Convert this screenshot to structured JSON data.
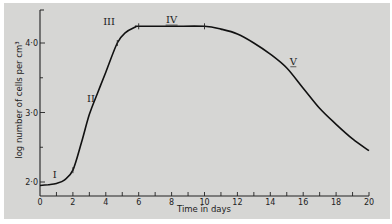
{
  "chart_data": {
    "type": "line",
    "title": "",
    "xlabel": "Time in days",
    "ylabel": "log number of cells per cm³",
    "xlim": [
      0,
      20
    ],
    "ylim": [
      1.8,
      4.5
    ],
    "x_ticks": [
      0,
      2,
      4,
      6,
      8,
      10,
      12,
      14,
      16,
      18,
      20
    ],
    "x_tick_labels": [
      "0",
      "2",
      "4",
      "6",
      "8",
      "10",
      "12",
      "14",
      "16",
      "18",
      "20"
    ],
    "y_ticks": [
      2.0,
      3.0,
      4.0
    ],
    "y_tick_labels": [
      "2·0",
      "3·0",
      "4·0"
    ],
    "grid": false,
    "legend": null,
    "series": [
      {
        "name": "cell growth curve",
        "x": [
          0,
          0.5,
          1,
          1.5,
          2,
          2.5,
          3,
          3.5,
          4,
          4.7,
          5.2,
          5.8,
          6,
          8,
          10,
          11,
          12,
          13,
          14,
          15,
          16,
          17,
          18,
          19,
          20
        ],
        "y": [
          1.95,
          1.96,
          1.98,
          2.03,
          2.17,
          2.55,
          2.97,
          3.28,
          3.58,
          4.0,
          4.15,
          4.23,
          4.24,
          4.24,
          4.24,
          4.2,
          4.13,
          4.0,
          3.84,
          3.64,
          3.35,
          3.06,
          2.83,
          2.62,
          2.45
        ]
      }
    ],
    "annotations": [
      {
        "text": "I",
        "x": 0.9,
        "y": 2.1,
        "note": "lag phase"
      },
      {
        "text": "II",
        "x": 3.1,
        "y": 3.2,
        "note": "exponential phase"
      },
      {
        "text": "III",
        "x": 4.2,
        "y": 4.3,
        "note": "deceleration phase"
      },
      {
        "text": "IV",
        "x": 8,
        "y": 4.33,
        "note": "stationary phase"
      },
      {
        "text": "V",
        "x": 15.4,
        "y": 3.73,
        "note": "decline phase"
      }
    ],
    "phase_markers_x": [
      2,
      4.7,
      6,
      10
    ]
  }
}
